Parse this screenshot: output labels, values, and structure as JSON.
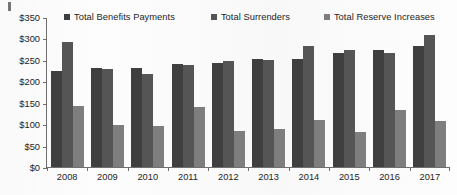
{
  "chart_data": {
    "type": "bar",
    "title": "",
    "subtitle": "",
    "xlabel": "",
    "ylabel": "",
    "categories": [
      "2008",
      "2009",
      "2010",
      "2011",
      "2012",
      "2013",
      "2014",
      "2015",
      "2016",
      "2017"
    ],
    "series": [
      {
        "name": "Total Benefits Payments",
        "color": "#3f3f3f",
        "values": [
          225,
          230,
          232,
          240,
          243,
          252,
          253,
          265,
          272,
          283
        ]
      },
      {
        "name": "Total Surrenders",
        "color": "#555555",
        "values": [
          292,
          228,
          217,
          237,
          247,
          249,
          283,
          273,
          266,
          309
        ]
      },
      {
        "name": "Total Reserve Increases",
        "color": "#7e7e7e",
        "values": [
          143,
          99,
          96,
          141,
          84,
          88,
          109,
          81,
          134,
          108
        ]
      }
    ],
    "ylim": [
      0,
      350
    ],
    "ytick_values": [
      0,
      50,
      100,
      150,
      200,
      250,
      300,
      350
    ],
    "ytick_labels": [
      "$0",
      "$50",
      "$100",
      "$150",
      "$200",
      "$250",
      "$300",
      "$350"
    ],
    "grid": false,
    "legend_position": "top"
  }
}
